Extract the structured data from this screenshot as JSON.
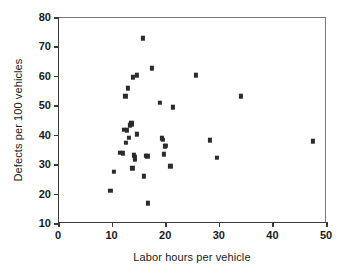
{
  "chart_data": {
    "type": "scatter",
    "title": "",
    "xlabel": "Labor hours per vehicle",
    "ylabel": "Defects per 100 vehicles",
    "xlim": [
      0,
      50
    ],
    "ylim": [
      10,
      80
    ],
    "xticks": [
      0,
      10,
      20,
      30,
      40,
      50
    ],
    "yticks": [
      10,
      20,
      30,
      40,
      50,
      60,
      70,
      80
    ],
    "xtick_labels": [
      "0",
      "10",
      "20",
      "30",
      "40",
      "50"
    ],
    "ytick_labels": [
      "10",
      "20",
      "30",
      "40",
      "50",
      "60",
      "70",
      "80"
    ],
    "grid": false,
    "legend": null,
    "marker": "square",
    "marker_color": "#2b2b2b",
    "series": [
      {
        "name": "plants",
        "points": [
          [
            9.6,
            21.3
          ],
          [
            10.2,
            27.8
          ],
          [
            11.4,
            34.2
          ],
          [
            11.9,
            34.0
          ],
          [
            12.1,
            42.0
          ],
          [
            12.4,
            53.4
          ],
          [
            12.5,
            37.6
          ],
          [
            12.6,
            41.9
          ],
          [
            12.8,
            56.1
          ],
          [
            13.1,
            39.3
          ],
          [
            13.3,
            43.6
          ],
          [
            13.5,
            44.2
          ],
          [
            13.6,
            44.0
          ],
          [
            13.7,
            28.9
          ],
          [
            13.8,
            59.9
          ],
          [
            13.9,
            33.4
          ],
          [
            14.1,
            32.6
          ],
          [
            14.2,
            31.8
          ],
          [
            14.5,
            60.6
          ],
          [
            14.6,
            40.6
          ],
          [
            15.6,
            73.1
          ],
          [
            15.9,
            26.3
          ],
          [
            16.2,
            33.2
          ],
          [
            16.5,
            33.1
          ],
          [
            16.6,
            17.1
          ],
          [
            17.3,
            62.9
          ],
          [
            18.8,
            51.2
          ],
          [
            19.2,
            39.2
          ],
          [
            19.4,
            38.7
          ],
          [
            19.5,
            33.8
          ],
          [
            19.8,
            36.4
          ],
          [
            20.0,
            36.6
          ],
          [
            20.8,
            29.6
          ],
          [
            21.3,
            49.7
          ],
          [
            25.5,
            60.6
          ],
          [
            28.2,
            38.4
          ],
          [
            29.4,
            32.5
          ],
          [
            34.0,
            53.4
          ],
          [
            47.4,
            38.2
          ]
        ]
      }
    ]
  }
}
